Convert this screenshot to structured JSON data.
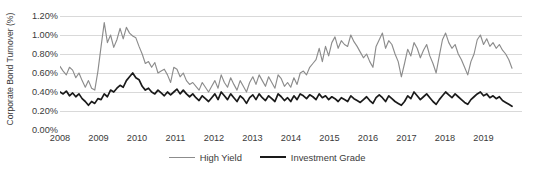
{
  "chart_data": {
    "type": "line",
    "title": "",
    "xlabel": "",
    "ylabel": "Corporate Bond Turnover (%)",
    "ylim": [
      0,
      1.2
    ],
    "ytick_labels": [
      "0.00%",
      "0.20%",
      "0.40%",
      "0.60%",
      "0.80%",
      "1.00%",
      "1.20%"
    ],
    "ytick_values": [
      0,
      0.2,
      0.4,
      0.6,
      0.8,
      1.0,
      1.2
    ],
    "xtick_labels": [
      "2008",
      "2009",
      "2010",
      "2011",
      "2012",
      "2013",
      "2014",
      "2015",
      "2016",
      "2017",
      "2018",
      "2019"
    ],
    "xtick_values": [
      2008,
      2009,
      2010,
      2011,
      2012,
      2013,
      2014,
      2015,
      2016,
      2017,
      2018,
      2019
    ],
    "xlim": [
      2008,
      2020
    ],
    "grid": "horizontal",
    "legend_position": "bottom-center",
    "colors": {
      "high_yield": "#8c8c8c",
      "investment_grade": "#1a1a1a",
      "gridline": "#d9d9d9"
    },
    "series": [
      {
        "name": "High Yield",
        "color": "#8c8c8c",
        "values": [
          0.67,
          0.62,
          0.58,
          0.66,
          0.63,
          0.55,
          0.6,
          0.52,
          0.45,
          0.52,
          0.44,
          0.42,
          0.62,
          0.88,
          1.13,
          0.92,
          1.0,
          0.87,
          0.95,
          1.07,
          0.96,
          1.08,
          1.02,
          0.99,
          0.97,
          0.88,
          0.8,
          0.7,
          0.72,
          0.66,
          0.71,
          0.6,
          0.62,
          0.64,
          0.58,
          0.5,
          0.66,
          0.64,
          0.56,
          0.6,
          0.52,
          0.48,
          0.5,
          0.46,
          0.42,
          0.5,
          0.45,
          0.4,
          0.46,
          0.52,
          0.44,
          0.58,
          0.5,
          0.45,
          0.55,
          0.48,
          0.42,
          0.52,
          0.46,
          0.4,
          0.5,
          0.56,
          0.48,
          0.58,
          0.52,
          0.46,
          0.56,
          0.5,
          0.44,
          0.58,
          0.54,
          0.46,
          0.5,
          0.45,
          0.55,
          0.48,
          0.6,
          0.62,
          0.58,
          0.66,
          0.7,
          0.74,
          0.86,
          0.72,
          0.88,
          0.78,
          0.92,
          0.98,
          0.86,
          0.94,
          0.9,
          0.88,
          1.0,
          0.93,
          0.88,
          0.82,
          0.76,
          0.8,
          0.72,
          0.66,
          0.88,
          0.95,
          1.02,
          0.86,
          0.94,
          0.9,
          0.8,
          0.72,
          0.56,
          0.7,
          0.85,
          0.78,
          0.92,
          0.86,
          0.76,
          0.84,
          0.9,
          0.78,
          0.7,
          0.6,
          0.78,
          0.95,
          1.02,
          0.92,
          0.86,
          0.9,
          0.8,
          0.74,
          0.66,
          0.58,
          0.72,
          0.8,
          0.95,
          1.0,
          0.9,
          0.96,
          0.88,
          0.92,
          0.86,
          0.9,
          0.84,
          0.8,
          0.74,
          0.65
        ]
      },
      {
        "name": "Investment Grade",
        "color": "#1a1a1a",
        "values": [
          0.4,
          0.38,
          0.41,
          0.36,
          0.39,
          0.35,
          0.38,
          0.33,
          0.3,
          0.26,
          0.3,
          0.28,
          0.33,
          0.32,
          0.38,
          0.35,
          0.42,
          0.4,
          0.44,
          0.47,
          0.45,
          0.52,
          0.56,
          0.6,
          0.55,
          0.53,
          0.46,
          0.42,
          0.44,
          0.4,
          0.38,
          0.42,
          0.39,
          0.36,
          0.4,
          0.37,
          0.4,
          0.43,
          0.38,
          0.42,
          0.38,
          0.35,
          0.38,
          0.34,
          0.31,
          0.36,
          0.33,
          0.3,
          0.34,
          0.38,
          0.32,
          0.4,
          0.36,
          0.32,
          0.38,
          0.34,
          0.3,
          0.36,
          0.33,
          0.28,
          0.34,
          0.37,
          0.32,
          0.38,
          0.34,
          0.31,
          0.36,
          0.33,
          0.3,
          0.38,
          0.35,
          0.31,
          0.34,
          0.3,
          0.36,
          0.32,
          0.38,
          0.36,
          0.33,
          0.37,
          0.35,
          0.32,
          0.38,
          0.34,
          0.36,
          0.32,
          0.35,
          0.33,
          0.3,
          0.34,
          0.32,
          0.3,
          0.36,
          0.33,
          0.31,
          0.29,
          0.32,
          0.35,
          0.31,
          0.28,
          0.34,
          0.37,
          0.34,
          0.3,
          0.36,
          0.33,
          0.3,
          0.28,
          0.26,
          0.3,
          0.36,
          0.33,
          0.4,
          0.36,
          0.32,
          0.35,
          0.38,
          0.34,
          0.3,
          0.27,
          0.32,
          0.36,
          0.4,
          0.37,
          0.34,
          0.38,
          0.35,
          0.32,
          0.29,
          0.27,
          0.32,
          0.35,
          0.38,
          0.4,
          0.36,
          0.38,
          0.34,
          0.36,
          0.33,
          0.35,
          0.31,
          0.29,
          0.27,
          0.25
        ]
      }
    ]
  },
  "legend": {
    "items": [
      {
        "label": "High Yield"
      },
      {
        "label": "Investment Grade"
      }
    ]
  }
}
